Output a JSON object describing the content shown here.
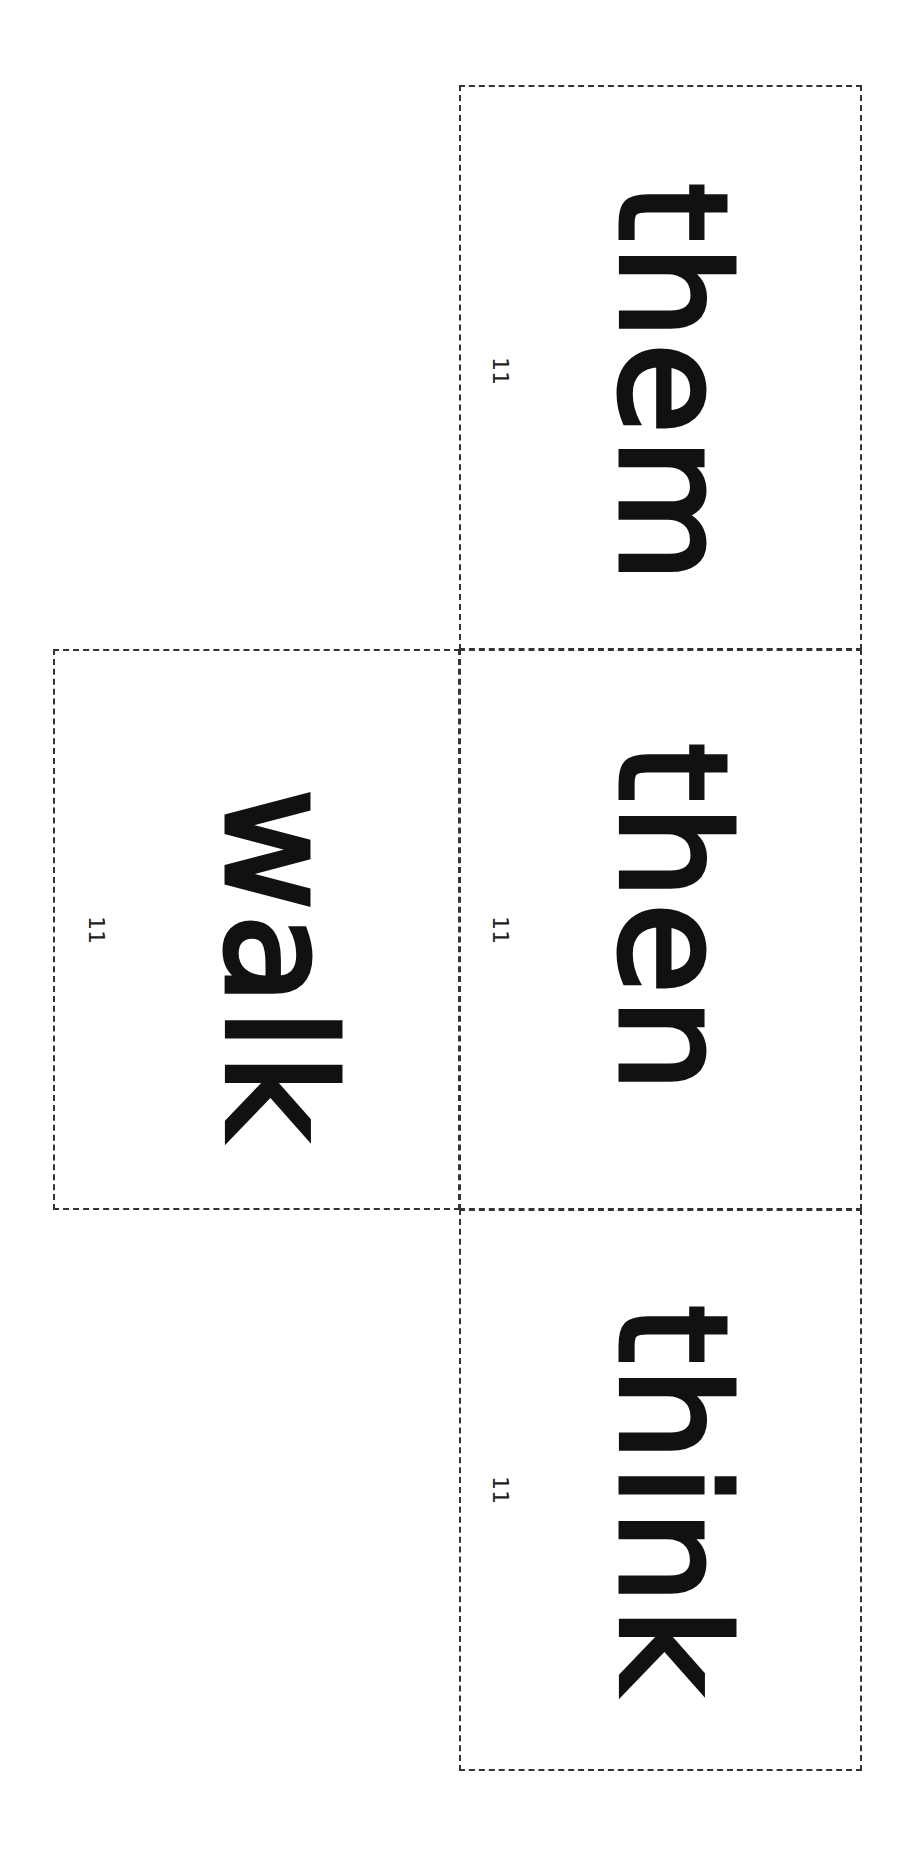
{
  "page": {
    "type": "sight-word flash cards (rotated 90°)",
    "cards": [
      {
        "id": "them",
        "word": "them",
        "number": "11"
      },
      {
        "id": "then",
        "word": "then",
        "number": "11"
      },
      {
        "id": "think",
        "word": "think",
        "number": "11"
      },
      {
        "id": "walk",
        "word": "walk",
        "number": "11"
      }
    ]
  },
  "style": {
    "ink": "#111111",
    "border": "#333333",
    "background": "#ffffff"
  }
}
